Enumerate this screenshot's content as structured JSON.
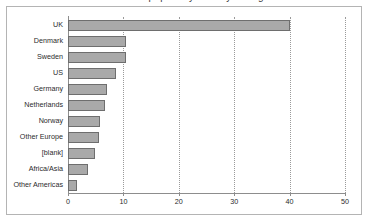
{
  "title": "Number of papers by country of origin",
  "chart_data": {
    "type": "bar",
    "orientation": "horizontal",
    "title": "Number of papers by country of origin",
    "xlabel": "",
    "ylabel": "",
    "xlim": [
      0,
      50
    ],
    "grid": true,
    "legend": false,
    "categories": [
      "UK",
      "Denmark",
      "Sweden",
      "US",
      "Germany",
      "Netherlands",
      "Norway",
      "Other Europe",
      "[blank]",
      "Africa/Asia",
      "Other Americas"
    ],
    "values": [
      40,
      10.5,
      10.5,
      8.7,
      7.0,
      6.7,
      5.7,
      5.6,
      4.8,
      3.6,
      1.6
    ],
    "xticks": [
      0,
      10,
      20,
      30,
      40,
      50
    ],
    "xtick_labels": [
      "0",
      "10",
      "20",
      "30",
      "40",
      "50"
    ],
    "colors": {
      "bar_fill": "#a9a9a9",
      "bar_border": "#6e6e6e",
      "axis": "#8d8d8d",
      "grid": "#9a9a9a",
      "frame": "#b4b4b4",
      "text": "#2b2b2b",
      "background": "#ffffff"
    }
  }
}
